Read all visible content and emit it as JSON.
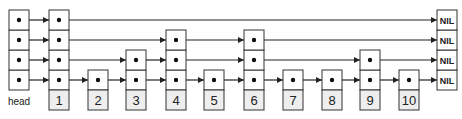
{
  "diagram": {
    "type": "skip-list",
    "levels": 4,
    "head_label": "head",
    "nil_label": "NIL",
    "nodes": [
      {
        "key": "1",
        "height": 4,
        "x": 49
      },
      {
        "key": "2",
        "height": 1,
        "x": 88
      },
      {
        "key": "3",
        "height": 2,
        "x": 126
      },
      {
        "key": "4",
        "height": 3,
        "x": 166
      },
      {
        "key": "5",
        "height": 1,
        "x": 204
      },
      {
        "key": "6",
        "height": 3,
        "x": 244
      },
      {
        "key": "7",
        "height": 1,
        "x": 283
      },
      {
        "key": "8",
        "height": 1,
        "x": 322
      },
      {
        "key": "9",
        "height": 2,
        "x": 360
      },
      {
        "key": "10",
        "height": 1,
        "x": 399
      }
    ],
    "head_x": 9,
    "nil_x": 437,
    "colors": {
      "stroke": "#333333",
      "key_fill": "#eeeeee",
      "cell_fill": "#ffffff"
    }
  }
}
